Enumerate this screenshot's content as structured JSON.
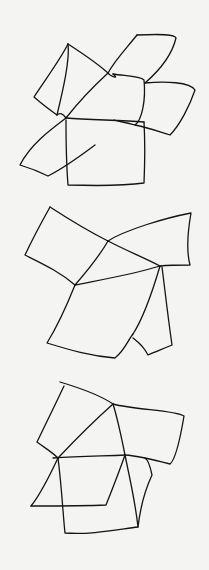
{
  "canvas": {
    "width": 209,
    "height": 570,
    "background": "#f4f4f2",
    "stroke_color": "#141414"
  },
  "sketches": [
    {
      "name": "sketch-1",
      "description": "Hand-drawn pinwheel of overlapping quadrilaterals",
      "paths": [
        "M68,44 C60,60 45,80 34,97 C42,104 50,110 57,115 C60,112 63,114 66,118",
        "M68,44 C70,60 63,90 57,115",
        "M68,44 C85,55 100,65 110,75 C115,78 118,78 113,74",
        "M137,35 C160,34 175,34 176,38 C172,55 160,70 145,83",
        "M137,35 C125,50 115,60 108,73",
        "M108,73 C95,85 80,100 66,118",
        "M113,74 C125,76 140,76 144,80 C146,100 142,120 135,125 C125,122 120,122 114,120",
        "M145,83 C165,81 190,82 195,90 C190,105 180,125 170,135 C160,132 150,128 135,125",
        "M66,118 C90,120 120,120 144,122",
        "M66,118 C50,130 30,145 20,165 C30,168 40,172 48,176 C60,170 75,160 95,145",
        "M66,120 C66,140 66,160 68,185 C100,186 130,185 144,183 C145,160 145,140 144,122"
      ]
    },
    {
      "name": "sketch-2",
      "description": "Hand-drawn fan of folded quadrilaterals",
      "paths": [
        "M50,207 C40,225 32,240 25,255 C45,265 60,272 75,285",
        "M50,207 C70,220 90,232 108,241",
        "M108,241 C125,230 165,218 191,213 C188,230 186,250 190,265 C180,265 170,265 160,266",
        "M108,241 C125,250 145,258 160,266",
        "M108,241 C100,255 88,270 75,285",
        "M75,285 C100,280 130,275 160,266",
        "M75,285 C65,310 55,330 47,343 C70,350 90,356 115,358 C125,350 128,340 133,334",
        "M160,266 C150,300 142,320 133,334",
        "M162,267 C165,290 167,310 172,345 C160,350 155,352 148,355 C143,345 138,342 133,338"
      ]
    },
    {
      "name": "sketch-3",
      "description": "Hand-drawn cluster of joined quadrilaterals",
      "paths": [
        "M64,386 C55,405 45,425 37,442 C45,448 52,452 58,458",
        "M60,382 C80,388 100,395 113,404",
        "M113,404 C135,410 175,410 184,416 C180,440 175,460 170,464 C155,460 140,456 125,455",
        "M113,404 C95,420 75,440 58,458",
        "M113,404 C118,420 122,440 125,455",
        "M53,458 C80,456 105,456 125,455",
        "M125,455 C118,475 110,495 106,505 C85,506 60,506 31,506",
        "M58,458 C50,475 40,495 31,506",
        "M58,458 C62,490 63,515 65,533 C90,535 115,530 138,527",
        "M125,455 C130,480 135,500 138,527 C140,510 145,490 152,475 C150,465 148,460 145,458"
      ]
    }
  ]
}
